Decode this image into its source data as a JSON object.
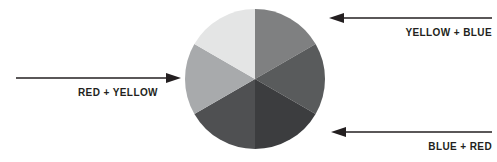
{
  "canvas": {
    "width": 497,
    "height": 162,
    "background": "#ffffff"
  },
  "diagram": {
    "type": "color-mixing-wheel",
    "title": "",
    "wheel": {
      "center_x": 71,
      "center_y": 71,
      "radius": 70,
      "segment_count": 6,
      "segments": [
        {
          "name": "segment-top-right",
          "label": "",
          "start_angle": 0,
          "end_angle": 60,
          "color": "#7f8081"
        },
        {
          "name": "segment-right",
          "label": "",
          "start_angle": 60,
          "end_angle": 120,
          "color": "#595b5c"
        },
        {
          "name": "segment-bottom-right",
          "label": "",
          "start_angle": 120,
          "end_angle": 180,
          "color": "#3c3d3f"
        },
        {
          "name": "segment-bottom-left",
          "label": "",
          "start_angle": 180,
          "end_angle": 240,
          "color": "#4f5052"
        },
        {
          "name": "segment-left",
          "label": "",
          "start_angle": 240,
          "end_angle": 300,
          "color": "#a8aaac"
        },
        {
          "name": "segment-top-left",
          "label": "",
          "start_angle": 300,
          "end_angle": 360,
          "color": "#e4e5e5"
        }
      ]
    },
    "annotations": [
      {
        "id": "red-yellow",
        "label": "RED + YELLOW",
        "direction": "right",
        "line_color": "#231f20",
        "text_color": "#231f20"
      },
      {
        "id": "yellow-blue",
        "label": "YELLOW + BLUE",
        "direction": "left",
        "line_color": "#231f20",
        "text_color": "#231f20"
      },
      {
        "id": "blue-red",
        "label": "BLUE + RED",
        "direction": "left",
        "line_color": "#231f20",
        "text_color": "#231f20"
      }
    ]
  }
}
